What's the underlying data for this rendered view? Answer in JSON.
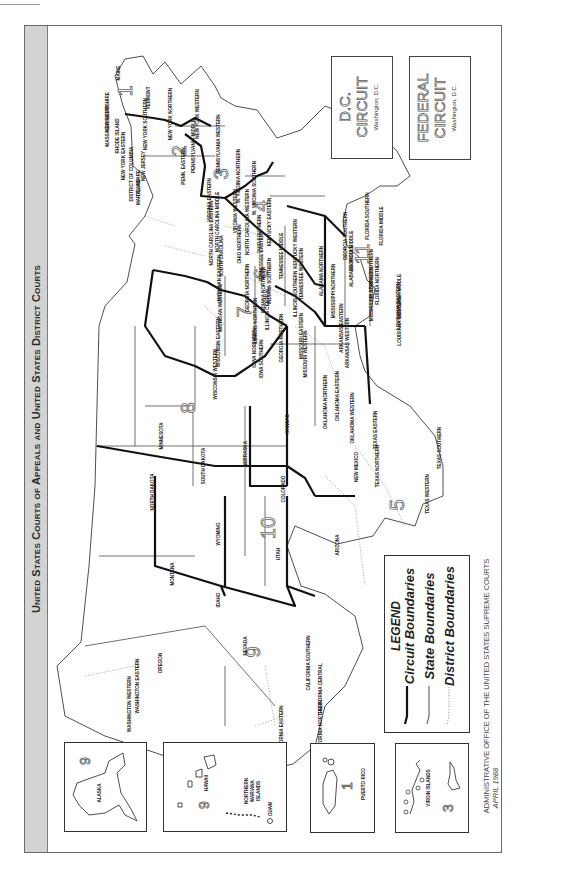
{
  "document": {
    "title": "United States Courts of Appeals and United States District Courts",
    "footnote_office": "ADMINISTRATIVE OFFICE OF THE UNITED STATES SUPREME COURTS",
    "footnote_date": "APRIL 1988"
  },
  "legend": {
    "title": "LEGEND",
    "items": [
      {
        "label": "Circuit Boundaries",
        "style": "thick-solid"
      },
      {
        "label": "State Boundaries",
        "style": "thin-solid"
      },
      {
        "label": "District Boundaries",
        "style": "dotted"
      }
    ]
  },
  "circuit_boxes": [
    {
      "title_line1": "D.C.",
      "title_line2": "CIRCUIT",
      "subtitle": "Washington, D.C."
    },
    {
      "title_line1": "FEDERAL",
      "title_line2": "CIRCUIT",
      "subtitle": "Washington, D.C."
    }
  ],
  "insets": [
    {
      "name": "ALASKA",
      "circuit": "9"
    },
    {
      "name": "HAWAII",
      "extra": [
        "NORTHERN",
        "MARIANA",
        "ISLANDS"
      ],
      "extra2": "GUAM",
      "circuit": "9"
    },
    {
      "name": "PUERTO RICO",
      "circuit": "1"
    },
    {
      "name": "VIRGIN ISLANDS",
      "circuit": "3"
    }
  ],
  "circuits": {
    "c1": "1",
    "c2": "2",
    "c3": "3",
    "c4": "4",
    "c5": "5",
    "c6": "6",
    "c7": "7",
    "c8": "8",
    "c9": "9",
    "c10": "10",
    "c11": "11"
  },
  "districts": {
    "maine": "MAINE",
    "new_hampshire": "NEW HAMPSHIRE",
    "massachusetts": "MASSACHUSETTS",
    "rhode_island": "RHODE ISLAND",
    "vermont": "VERMONT",
    "ny_eastern": "NEW YORK EASTERN",
    "ny_southern": "NEW YORK SOUTHERN",
    "ny_northern": "NEW YORK NORTHERN",
    "ny_western": "NEW YORK WESTERN",
    "connecticut": "CONNECTICUT",
    "new_jersey": "NEW JERSEY",
    "dist_columbia": "DISTRICT OF COLUMBIA",
    "delaware": "DELAWARE",
    "maryland": "MARYLAND",
    "pa_middle": "PENNSYLVANIA MIDDLE",
    "pa_eastern": "PENN. EASTERN",
    "pa_western": "PENNSYLVANIA WESTERN",
    "va_eastern": "VIRGINIA EASTERN",
    "va_western": "VIRGINIA WESTERN",
    "wv_northern": "W. VIRGINIA NORTHERN",
    "wv_southern": "W. VIRGINIA SOUTHERN",
    "nc_eastern": "NORTH CAROLINA EASTERN",
    "nc_middle": "NORTH CAROLINA MIDDLE",
    "nc_western": "NORTH CAROLINA WESTERN",
    "south_carolina": "SOUTH CAROLINA",
    "oh_northern": "OHIO NORTHERN",
    "oh_southern": "OHIO SOUTHERN",
    "ky_eastern": "KENTUCKY EASTERN",
    "ky_western": "KENTUCKY WESTERN",
    "tn_eastern": "TENNESSEE EASTERN",
    "tn_middle": "TENNESSEE MIDDLE",
    "tn_western": "TENNESSEE WESTERN",
    "mi_eastern": "MICHIGAN EASTERN",
    "mi_western": "MICHIGAN WESTERN",
    "in_northern": "INDIANA NORTHERN",
    "in_southern": "INDIANA SOUTHERN",
    "il_northern": "ILLINOIS NORTHERN",
    "il_central": "ILLINOIS CENTRAL",
    "il_southern": "ILLINOIS SOUTHERN",
    "wi_eastern": "WISCONSIN EASTERN",
    "wi_western": "WISCONSIN WESTERN",
    "ga_northern": "GEORGIA NORTHERN",
    "ga_middle": "GEORGIA MIDDLE",
    "ga_southern": "GEORGIA SOUTHERN",
    "fl_northern": "FLORIDA NORTHERN",
    "fl_middle": "FLORIDA MIDDLE",
    "fl_southern": "FLORIDA SOUTHERN",
    "al_northern": "ALABAMA NORTHERN",
    "al_middle": "ALABAMA MIDDLE",
    "al_southern": "ALABAMA SOUTHERN",
    "ms_northern": "MISSISSIPPI NORTHERN",
    "ms_southern": "MISSISSIPPI SOUTHERN",
    "la_western": "LOUISIANA WESTERN",
    "la_middle": "LOUISIANA MIDDLE",
    "la_eastern": "LOUISIANA EASTERN",
    "ar_eastern": "ARKANSAS EASTERN",
    "ar_western": "ARKANSAS WESTERN",
    "mo_eastern": "MISSOURI EASTERN",
    "mo_western": "MISSOURI WESTERN",
    "ia_northern": "IOWA NORTHERN",
    "ia_southern": "IOWA SOUTHERN",
    "minnesota": "MINNESOTA",
    "north_dakota": "NORTH DAKOTA",
    "south_dakota": "SOUTH DAKOTA",
    "nebraska": "NEBRASKA",
    "kansas": "KANSAS",
    "ok_northern": "OKLAHOMA NORTHERN",
    "ok_eastern": "OKLAHOMA EASTERN",
    "ok_western": "OKLAHOMA WESTERN",
    "tx_northern": "TEXAS NORTHERN",
    "tx_eastern": "TEXAS EASTERN",
    "tx_southern": "TEXAS SOUTHERN",
    "tx_western": "TEXAS WESTERN",
    "montana": "MONTANA",
    "wyoming": "WYOMING",
    "colorado": "COLORADO",
    "new_mexico": "NEW MEXICO",
    "utah": "UTAH",
    "arizona": "ARIZONA",
    "idaho": "IDAHO",
    "nevada": "NEVADA",
    "oregon": "OREGON",
    "wa_eastern": "WASHINGTON EASTERN",
    "wa_western": "WASHINGTON WESTERN",
    "ca_northern": "CALIFORNIA NORTHERN",
    "ca_eastern": "CALIFORNIA EASTERN",
    "ca_central": "CALIFORNIA CENTRAL",
    "ca_southern": "CALIFORNIA SOUTHERN"
  }
}
